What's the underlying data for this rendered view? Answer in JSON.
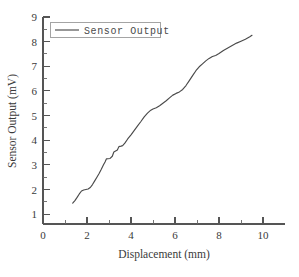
{
  "chart_data": {
    "type": "line",
    "title": "",
    "xlabel": "Displacement (mm)",
    "ylabel": "Sensor Output (mV)",
    "xlim": [
      0,
      11
    ],
    "ylim": [
      0.6,
      9
    ],
    "grid": false,
    "legend_position": "top-left",
    "x_ticks_major": [
      0,
      2,
      4,
      6,
      8,
      10
    ],
    "x_ticks_minor": [
      1,
      3,
      5,
      7,
      9
    ],
    "y_ticks_major": [
      1,
      2,
      3,
      4,
      5,
      6,
      7,
      8,
      9
    ],
    "y_ticks_minor": [
      1.5,
      2.5,
      3.5,
      4.5,
      5.5,
      6.5,
      7.5,
      8.5
    ],
    "series": [
      {
        "name": "Sensor Output",
        "color": "#4a4a4a",
        "x": [
          1.35,
          1.45,
          1.55,
          1.65,
          1.75,
          1.85,
          1.95,
          2.05,
          2.15,
          2.25,
          2.35,
          2.45,
          2.55,
          2.65,
          2.75,
          2.82,
          2.88,
          2.95,
          3.05,
          3.15,
          3.22,
          3.3,
          3.38,
          3.45,
          3.55,
          3.62,
          3.72,
          3.85,
          4.0,
          4.15,
          4.3,
          4.45,
          4.6,
          4.75,
          4.9,
          5.0,
          5.15,
          5.3,
          5.45,
          5.6,
          5.75,
          5.9,
          6.05,
          6.2,
          6.35,
          6.5,
          6.65,
          6.8,
          6.95,
          7.1,
          7.25,
          7.4,
          7.55,
          7.7,
          7.85,
          8.0,
          8.2,
          8.4,
          8.6,
          8.8,
          9.0,
          9.2,
          9.4,
          9.5
        ],
        "y": [
          1.45,
          1.55,
          1.68,
          1.82,
          1.94,
          1.98,
          2.0,
          2.02,
          2.08,
          2.2,
          2.35,
          2.5,
          2.65,
          2.82,
          3.0,
          3.12,
          3.24,
          3.25,
          3.26,
          3.35,
          3.52,
          3.56,
          3.6,
          3.74,
          3.76,
          3.78,
          3.88,
          4.05,
          4.22,
          4.4,
          4.58,
          4.76,
          4.95,
          5.1,
          5.22,
          5.27,
          5.32,
          5.4,
          5.5,
          5.6,
          5.72,
          5.83,
          5.9,
          5.96,
          6.06,
          6.22,
          6.42,
          6.62,
          6.82,
          6.98,
          7.1,
          7.22,
          7.32,
          7.4,
          7.44,
          7.52,
          7.64,
          7.74,
          7.84,
          7.94,
          8.02,
          8.1,
          8.2,
          8.26
        ]
      }
    ]
  },
  "legend": {
    "entries": [
      {
        "label": "Sensor Output"
      }
    ]
  },
  "axes": {
    "x_label": "Displacement (mm)",
    "y_label": "Sensor Output (mV)",
    "x_tick_labels": [
      "0",
      "2",
      "4",
      "6",
      "8",
      "10"
    ],
    "y_tick_labels": [
      "1",
      "2",
      "3",
      "4",
      "5",
      "6",
      "7",
      "8",
      "9"
    ]
  },
  "colors": {
    "background": "#ffffff",
    "axis": "#555555",
    "series": "#4a4a4a",
    "text": "#3a3a3a",
    "legend_border": "#9a9a9a"
  }
}
